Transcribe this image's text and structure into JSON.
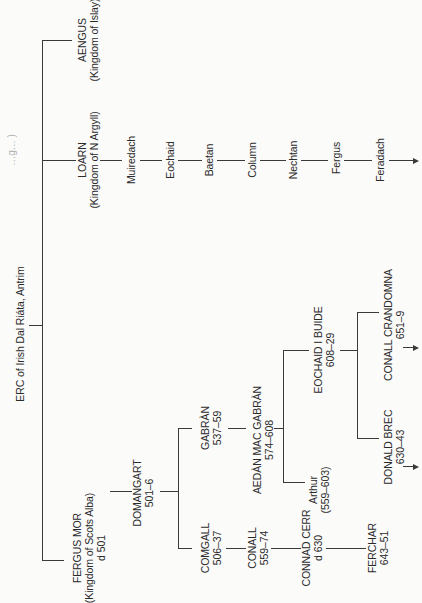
{
  "diagram": {
    "type": "family-tree",
    "orientation": "rotated-90-ccw",
    "edge_caption_fragment": "…g… )",
    "root": {
      "name": "ERC of Irish Dal Riáta, Antrim"
    },
    "sons": [
      {
        "name": "AENGUS",
        "note": "(Kingdom of Islay)"
      },
      {
        "name": "LOARN",
        "note": "(Kingdom of N Argyll)"
      },
      {
        "name": "FERGUS MOR",
        "note": "(Kingdom of Scots Alba)",
        "dates": "d 501"
      }
    ],
    "loarn_line": [
      "Muiredach",
      "Eochaid",
      "Baetan",
      "Column",
      "Nechtan",
      "Fergus",
      "Feradach"
    ],
    "fergus_line": {
      "domangart": {
        "name": "DOMANGART",
        "dates": "501–6"
      },
      "gabran": {
        "name": "GABRÀN",
        "dates": "537–59"
      },
      "comgall": {
        "name": "COMGALL",
        "dates": "506–37"
      },
      "aedan": {
        "name": "AEDÀN MAC GABRÀN",
        "dates": "574–608"
      },
      "conall": {
        "name": "CONALL",
        "dates": "559–74"
      },
      "eochaid_buide": {
        "name": "EOCHAID I BUIDE",
        "dates": "608–29"
      },
      "arthur": {
        "name": "Arthur",
        "dates": "(559–603)"
      },
      "connad_cerr": {
        "name": "CONNAD CERR",
        "dates": "d 630"
      },
      "conall_crandomna": {
        "name": "CONALL CRANDOMNA",
        "dates": "651–9"
      },
      "donald_brec": {
        "name": "DONALD BREC",
        "dates": "630–43"
      },
      "ferchar": {
        "name": "FERCHAR",
        "dates": "643–51"
      }
    },
    "line_color": "#3a3a3a",
    "background": "#fbfbfa"
  }
}
